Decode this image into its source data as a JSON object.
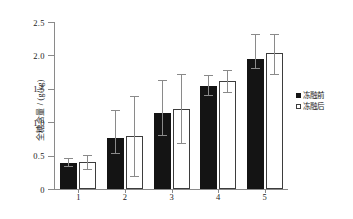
{
  "chart_data": {
    "type": "bar",
    "title": "",
    "xlabel": "",
    "ylabel": "全糖含量 / (g/kg)",
    "categories": [
      "1",
      "2",
      "3",
      "4",
      "5"
    ],
    "ylim": [
      0,
      2.5
    ],
    "ytick_labels": [
      "0",
      "0.5",
      "1.0",
      "1.5",
      "2.0",
      "2.5"
    ],
    "ytick_values": [
      0,
      0.5,
      1.0,
      1.5,
      2.0,
      2.5
    ],
    "grid": false,
    "legend_position": "right",
    "series": [
      {
        "name": "冻融前",
        "color": "#141414",
        "fill": "solid",
        "values": [
          0.39,
          0.76,
          1.14,
          1.54,
          1.95
        ],
        "err_low": [
          0.33,
          0.53,
          0.8,
          1.39,
          1.8
        ],
        "err_high": [
          0.46,
          1.18,
          1.63,
          1.7,
          2.32
        ]
      },
      {
        "name": "冻融后",
        "color": "#ffffff",
        "fill": "open",
        "values": [
          0.41,
          0.79,
          1.2,
          1.62,
          2.03
        ],
        "err_low": [
          0.29,
          0.18,
          0.67,
          1.44,
          1.7
        ],
        "err_high": [
          0.51,
          1.4,
          1.72,
          1.78,
          2.32
        ]
      }
    ]
  },
  "legend": {
    "items": [
      {
        "label": "冻融前",
        "marker": "filled-square-marker"
      },
      {
        "label": "冻融后",
        "marker": "open-square-marker"
      }
    ]
  }
}
